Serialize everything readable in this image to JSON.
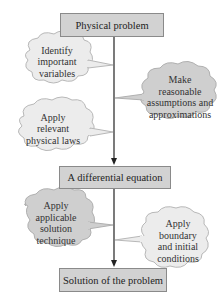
{
  "diagram": {
    "boxes": {
      "physical_problem": "Physical problem",
      "differential_equation": "A differential equation",
      "solution": "Solution of the problem"
    },
    "clouds": {
      "identify_variables": [
        "Identify",
        "important",
        "variables"
      ],
      "make_assumptions": [
        "Make",
        "reasonable",
        "assumptions and",
        "approximations"
      ],
      "apply_laws": [
        "Apply",
        "relevant",
        "physical laws"
      ],
      "apply_technique": [
        "Apply",
        "applicable",
        "solution",
        "technique"
      ],
      "apply_conditions": [
        "Apply",
        "boundary",
        "and initial",
        "conditions"
      ]
    },
    "colors": {
      "box_fill": "#d2d2d2",
      "box_border": "#8a8a8a",
      "cloud_fill_light": "#ececec",
      "cloud_fill_dark": "#cfcfcf",
      "cloud_border": "#b0b0b0",
      "line": "#222222"
    }
  }
}
